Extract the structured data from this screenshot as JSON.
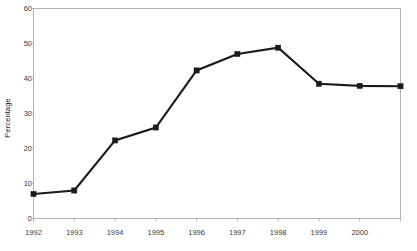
{
  "chart_data": {
    "type": "line",
    "title": "",
    "xlabel": "",
    "ylabel": "Percentage",
    "ylim": [
      0,
      60
    ],
    "ytick_step": 10,
    "yticks": [
      "0",
      "10",
      "20",
      "30",
      "40",
      "50",
      "60"
    ],
    "grid": false,
    "legend": false,
    "legend_position": "none",
    "marker": "filled-square",
    "line_color": "#1a1a1a",
    "axis_color": "#b3b3b3",
    "background_color": "#ffffff",
    "categories": [
      "1992",
      "1993",
      "1994",
      "1995",
      "1996",
      "1997",
      "1998",
      "1999",
      "2000",
      ""
    ],
    "xtick_labels": [
      "1992",
      "1993",
      "1994",
      "1995",
      "1996",
      "1997",
      "1998",
      "1999",
      "2000"
    ],
    "values": [
      7,
      8,
      22.3,
      26,
      42.3,
      47,
      48.8,
      38.5,
      37.9,
      37.8
    ],
    "series": [
      {
        "name": "Percentage",
        "values": [
          7,
          8,
          22.3,
          26,
          42.3,
          47,
          48.8,
          38.5,
          37.9,
          37.8
        ]
      }
    ]
  },
  "axis": {
    "y_title": "Percentage"
  }
}
